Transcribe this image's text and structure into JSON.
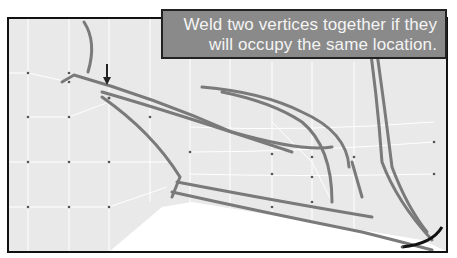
{
  "caption": {
    "line1": "Weld two vertices together if they",
    "line2": "will occupy the same location."
  },
  "viewport": {
    "background": "#e9e9e9",
    "mesh_line_color": "#ffffff",
    "vertex_color": "#555555",
    "stroke_color": "#7a7a7a"
  },
  "annotation": {
    "icon": "down-arrow-icon",
    "target": "vertex to weld"
  }
}
